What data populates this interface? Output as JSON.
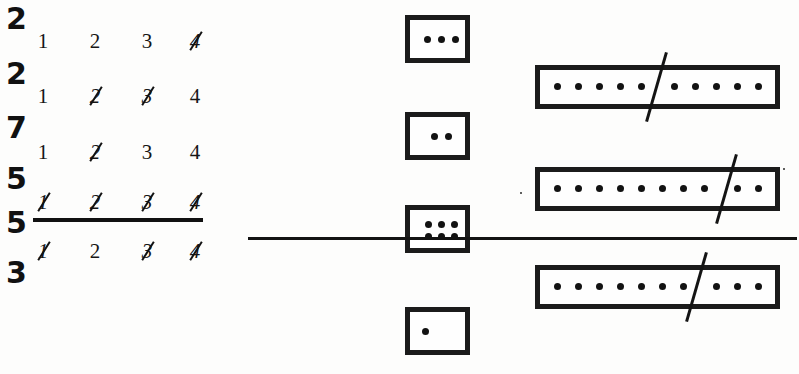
{
  "page": {
    "width": 799,
    "height": 374,
    "background": "#fdfdfc",
    "ink_color": "#151515"
  },
  "left_panel": {
    "name": "tally-and-numbers-column",
    "tally_digits": [
      {
        "value": "2",
        "top": 4
      },
      {
        "value": "2",
        "top": 59
      },
      {
        "value": "7",
        "top": 113
      },
      {
        "value": "5",
        "top": 164
      },
      {
        "value": "5",
        "top": 208
      },
      {
        "value": "3",
        "top": 258
      }
    ],
    "number_rows": [
      {
        "top": 28,
        "cells": [
          {
            "value": "1",
            "struck": false
          },
          {
            "value": "2",
            "struck": false
          },
          {
            "value": "3",
            "struck": false
          },
          {
            "value": "4",
            "struck": true
          }
        ]
      },
      {
        "top": 83,
        "cells": [
          {
            "value": "1",
            "struck": false
          },
          {
            "value": "2",
            "struck": true
          },
          {
            "value": "3",
            "struck": true
          },
          {
            "value": "4",
            "struck": false
          }
        ]
      },
      {
        "top": 139,
        "cells": [
          {
            "value": "1",
            "struck": false
          },
          {
            "value": "2",
            "struck": true
          },
          {
            "value": "3",
            "struck": false
          },
          {
            "value": "4",
            "struck": false
          }
        ]
      },
      {
        "top": 189,
        "cells": [
          {
            "value": "1",
            "struck": true
          },
          {
            "value": "2",
            "struck": true
          },
          {
            "value": "3",
            "struck": true
          },
          {
            "value": "4",
            "struck": true
          }
        ]
      },
      {
        "top": 238,
        "cells": [
          {
            "value": "1",
            "struck": true
          },
          {
            "value": "2",
            "struck": false
          },
          {
            "value": "3",
            "struck": true
          },
          {
            "value": "4",
            "struck": true
          }
        ]
      }
    ],
    "rule": {
      "name": "answer-line-left",
      "top": 218,
      "left": 33,
      "width": 170
    }
  },
  "right_panel": {
    "name": "dot-boxes-area",
    "small_boxes": [
      {
        "id": "small-box-1",
        "left": 155,
        "top": 15,
        "width": 65,
        "height": 48,
        "dot_count": 3,
        "layout": "row"
      },
      {
        "id": "small-box-2",
        "left": 155,
        "top": 112,
        "width": 65,
        "height": 48,
        "dot_count": 2,
        "layout": "row"
      },
      {
        "id": "small-box-3",
        "left": 155,
        "top": 205,
        "width": 65,
        "height": 48,
        "dot_count": 6,
        "layout": "grid-3x2"
      },
      {
        "id": "small-box-4",
        "left": 155,
        "top": 307,
        "width": 65,
        "height": 48,
        "dot_count": 1,
        "layout": "single"
      }
    ],
    "wide_boxes": [
      {
        "id": "wide-box-1",
        "left": 285,
        "top": 65,
        "width": 245,
        "height": 44,
        "dot_count": 10,
        "dots_left_of_slash": 5,
        "dots_right_of_slash": 5,
        "slash_x": 120
      },
      {
        "id": "wide-box-2",
        "left": 285,
        "top": 167,
        "width": 245,
        "height": 44,
        "dot_count": 10,
        "dots_left_of_slash": 8,
        "dots_right_of_slash": 2,
        "slash_x": 190
      },
      {
        "id": "wide-box-3",
        "left": 285,
        "top": 265,
        "width": 245,
        "height": 44,
        "dot_count": 10,
        "dots_left_of_slash": 7,
        "dots_right_of_slash": 3,
        "slash_x": 160
      }
    ],
    "rule": {
      "name": "answer-line-right",
      "top": 237,
      "left": 248,
      "width": 549
    }
  }
}
